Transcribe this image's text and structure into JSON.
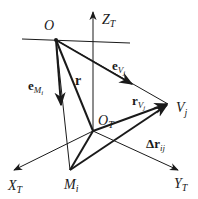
{
  "diagram": {
    "type": "vector-geometry",
    "colors": {
      "line": "#1a1a1a",
      "background": "#ffffff"
    },
    "points": {
      "O": {
        "label": "O",
        "x": 56,
        "y": 40
      },
      "O_T": {
        "label": "O",
        "sub": "T",
        "x": 93,
        "y": 131
      },
      "M_i": {
        "label": "M",
        "sub": "i",
        "x": 70,
        "y": 170
      },
      "V_j": {
        "label": "V",
        "sub": "j",
        "x": 168,
        "y": 104
      }
    },
    "axes": {
      "Z": {
        "label": "Z",
        "sub": "T"
      },
      "X": {
        "label": "X",
        "sub": "T"
      },
      "Y": {
        "label": "Y",
        "sub": "T"
      }
    },
    "vectors": {
      "r": {
        "label": "r"
      },
      "e_M": {
        "label": "e",
        "sub": "M",
        "subsub": "i"
      },
      "e_V": {
        "label": "e",
        "sub": "V",
        "subsub": "j"
      },
      "r_V": {
        "label": "r",
        "sub": "V",
        "subsub": "j"
      },
      "dr": {
        "label": "Δr",
        "sub": "ij"
      }
    }
  }
}
